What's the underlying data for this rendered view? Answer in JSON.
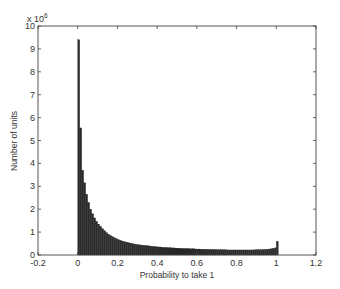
{
  "chart_data": {
    "type": "bar",
    "title": "",
    "xlabel": "Probability to take 1",
    "ylabel": "Number of units",
    "y_multiplier_label": "x 10",
    "y_multiplier_exponent": "6",
    "xlim": [
      -0.2,
      1.2
    ],
    "ylim": [
      0,
      10
    ],
    "grid": false,
    "legend": null,
    "x_ticks": [
      "-0.2",
      "0",
      "0.2",
      "0.4",
      "0.6",
      "0.8",
      "1",
      "1.2"
    ],
    "x_tick_values": [
      -0.2,
      0,
      0.2,
      0.4,
      0.6,
      0.8,
      1,
      1.2
    ],
    "y_ticks": [
      "0",
      "1",
      "2",
      "3",
      "4",
      "5",
      "6",
      "7",
      "8",
      "9",
      "10"
    ],
    "y_tick_values": [
      0,
      1,
      2,
      3,
      4,
      5,
      6,
      7,
      8,
      9,
      10
    ],
    "bin_width": 0.01,
    "bar_color": "#2b2b2b",
    "x": [
      0.0,
      0.01,
      0.02,
      0.03,
      0.04,
      0.05,
      0.06,
      0.07,
      0.08,
      0.09,
      0.1,
      0.11,
      0.12,
      0.13,
      0.14,
      0.15,
      0.16,
      0.17,
      0.18,
      0.19,
      0.2,
      0.21,
      0.22,
      0.23,
      0.24,
      0.25,
      0.26,
      0.27,
      0.28,
      0.29,
      0.3,
      0.31,
      0.32,
      0.33,
      0.34,
      0.35,
      0.36,
      0.37,
      0.38,
      0.39,
      0.4,
      0.41,
      0.42,
      0.43,
      0.44,
      0.45,
      0.46,
      0.47,
      0.48,
      0.49,
      0.5,
      0.51,
      0.52,
      0.53,
      0.54,
      0.55,
      0.56,
      0.57,
      0.58,
      0.59,
      0.6,
      0.61,
      0.62,
      0.63,
      0.64,
      0.65,
      0.66,
      0.67,
      0.68,
      0.69,
      0.7,
      0.71,
      0.72,
      0.73,
      0.74,
      0.75,
      0.76,
      0.77,
      0.78,
      0.79,
      0.8,
      0.81,
      0.82,
      0.83,
      0.84,
      0.85,
      0.86,
      0.87,
      0.88,
      0.89,
      0.9,
      0.91,
      0.92,
      0.93,
      0.94,
      0.95,
      0.96,
      0.97,
      0.98,
      0.99,
      1.0
    ],
    "values": [
      9.4,
      5.55,
      3.7,
      3.15,
      2.65,
      2.3,
      2.0,
      1.8,
      1.62,
      1.47,
      1.35,
      1.25,
      1.15,
      1.06,
      0.98,
      0.91,
      0.85,
      0.8,
      0.75,
      0.71,
      0.67,
      0.64,
      0.61,
      0.58,
      0.56,
      0.54,
      0.52,
      0.5,
      0.48,
      0.46,
      0.45,
      0.44,
      0.43,
      0.42,
      0.41,
      0.4,
      0.39,
      0.38,
      0.37,
      0.36,
      0.35,
      0.35,
      0.34,
      0.33,
      0.33,
      0.32,
      0.32,
      0.31,
      0.31,
      0.3,
      0.3,
      0.29,
      0.29,
      0.28,
      0.28,
      0.28,
      0.27,
      0.27,
      0.27,
      0.26,
      0.26,
      0.26,
      0.25,
      0.25,
      0.25,
      0.25,
      0.24,
      0.24,
      0.24,
      0.24,
      0.23,
      0.23,
      0.23,
      0.23,
      0.23,
      0.22,
      0.22,
      0.22,
      0.22,
      0.22,
      0.22,
      0.22,
      0.22,
      0.22,
      0.22,
      0.22,
      0.22,
      0.22,
      0.22,
      0.23,
      0.23,
      0.23,
      0.23,
      0.24,
      0.24,
      0.25,
      0.26,
      0.27,
      0.29,
      0.31,
      0.6
    ]
  }
}
